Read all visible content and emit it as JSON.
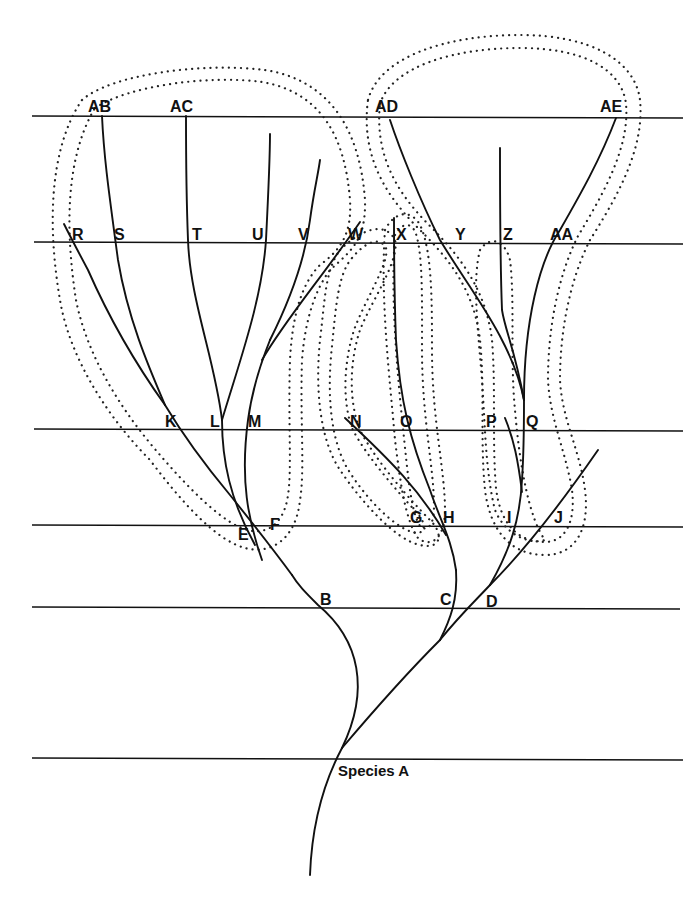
{
  "diagram": {
    "root_label": "Species A",
    "time_levels": [
      {
        "y": 758,
        "nodes": [
          "Species A"
        ]
      },
      {
        "y": 607,
        "nodes": [
          "B",
          "C",
          "D"
        ]
      },
      {
        "y": 526,
        "nodes": [
          "E",
          "F",
          "G",
          "H",
          "I",
          "J"
        ]
      },
      {
        "y": 430,
        "nodes": [
          "K",
          "L",
          "M",
          "N",
          "O",
          "P",
          "Q"
        ]
      },
      {
        "y": 242,
        "nodes": [
          "R",
          "S",
          "T",
          "U",
          "V",
          "W",
          "X",
          "Y",
          "Z",
          "AA"
        ]
      },
      {
        "y": 116,
        "nodes": [
          "AB",
          "AC",
          "AD",
          "AE"
        ]
      }
    ],
    "labels": {
      "species_a": "Species A",
      "B": "B",
      "C": "C",
      "D": "D",
      "E": "E",
      "F": "F",
      "G": "G",
      "H": "H",
      "I": "I",
      "J": "J",
      "K": "K",
      "L": "L",
      "M": "M",
      "N": "N",
      "O": "O",
      "P": "P",
      "Q": "Q",
      "R": "R",
      "S": "S",
      "T": "T",
      "U": "U",
      "V": "V",
      "W": "W",
      "X": "X",
      "Y": "Y",
      "Z": "Z",
      "AA": "AA",
      "AB": "AB",
      "AC": "AC",
      "AD": "AD",
      "AE": "AE"
    },
    "stippled_groups": [
      {
        "name": "left-clade",
        "members": [
          "AB",
          "AC",
          "R",
          "S",
          "T",
          "U",
          "V",
          "W",
          "K",
          "L",
          "M",
          "E",
          "F"
        ]
      },
      {
        "name": "middle-clade-N",
        "members": [
          "X",
          "N",
          "G"
        ]
      },
      {
        "name": "middle-clade-O",
        "members": [
          "X",
          "O",
          "H"
        ]
      },
      {
        "name": "right-clade",
        "members": [
          "AD",
          "AE",
          "Y",
          "Z",
          "AA",
          "P",
          "Q",
          "I",
          "J"
        ]
      }
    ],
    "colors": {
      "line": "#111111",
      "background": "#ffffff"
    }
  }
}
